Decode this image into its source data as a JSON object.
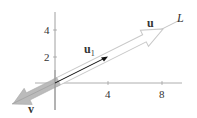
{
  "diagram": {
    "title": "",
    "axes": {
      "x_ticks": [
        {
          "value": 4,
          "label": "4"
        },
        {
          "value": 8,
          "label": "8"
        }
      ],
      "y_ticks": [
        {
          "value": 2,
          "label": "2"
        },
        {
          "value": 4,
          "label": "4"
        }
      ]
    },
    "line": {
      "label": "L"
    },
    "vectors": [
      {
        "name": "u",
        "label": "u",
        "x": 8,
        "y": 4,
        "style": "outlined-wide-arrow"
      },
      {
        "name": "u1",
        "label": "u",
        "subscript": "1",
        "x": 4,
        "y": 2,
        "style": "thin-black-arrow"
      },
      {
        "name": "v",
        "label": "v",
        "x": -3,
        "y": -1.5,
        "style": "gray-wide-arrow"
      }
    ],
    "colors": {
      "axis": "#555555",
      "line_L": "#bbbbbb",
      "u_outline": "#c8c8c8",
      "u1": "#111111",
      "v_fill": "#b5b5b5"
    }
  }
}
